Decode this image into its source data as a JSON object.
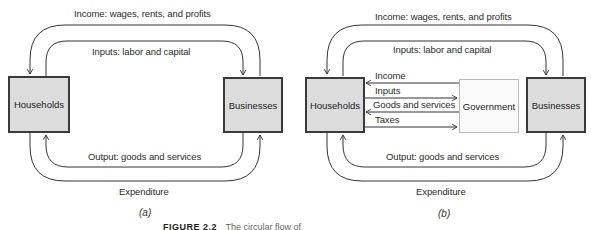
{
  "panel_a": {
    "label": "(a)",
    "nodes": {
      "households": "Households",
      "businesses": "Businesses"
    },
    "flows": {
      "income": "Income: wages, rents, and profits",
      "inputs": "Inputs: labor and capital",
      "output": "Output: goods and services",
      "expenditure": "Expenditure"
    }
  },
  "panel_b": {
    "label": "(b)",
    "nodes": {
      "households": "Households",
      "government": "Government",
      "businesses": "Businesses"
    },
    "flows": {
      "income": "Income: wages, rents, and profits",
      "inputs": "Inputs: labor and capital",
      "output": "Output: goods and services",
      "expenditure": "Expenditure"
    },
    "government_flows": {
      "income": "Income",
      "inputs": "Inputs",
      "goods_services": "Goods and services",
      "taxes": "Taxes"
    }
  },
  "caption": {
    "figure": "FIGURE 2.2",
    "text": "The circular flow of"
  },
  "colors": {
    "box_fill": "#dcdcdc",
    "box_border": "#3a3a3a",
    "gov_fill": "#fafafa",
    "gov_border": "#b8b8b8",
    "line": "#333333"
  }
}
